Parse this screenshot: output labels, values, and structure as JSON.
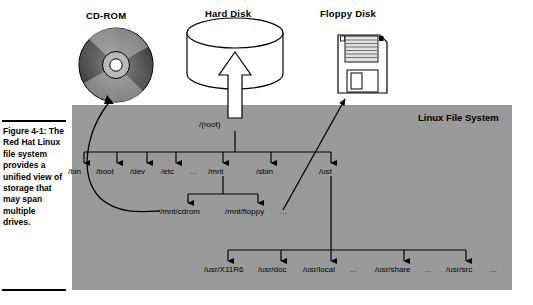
{
  "figure": {
    "caption_title": "Figure 4-1:",
    "caption_body": "The Red Hat Linux file system provides a unified view of storage that may span multiple drives."
  },
  "devices": [
    {
      "name": "cdrom-device",
      "label": "CD-ROM"
    },
    {
      "name": "harddisk-device",
      "label": "Hard Disk"
    },
    {
      "name": "floppy-device",
      "label": "Floppy Disk"
    }
  ],
  "panel": {
    "title": "Linux File System",
    "background_color": "#9a9a9a"
  },
  "tree": {
    "root": "/(root)",
    "level1": [
      {
        "label": "/bin",
        "x": 80
      },
      {
        "label": "/boot",
        "x": 107
      },
      {
        "label": "/dev",
        "x": 139
      },
      {
        "label": "/etc",
        "x": 168
      },
      {
        "label": "...",
        "x": 195,
        "ellipsis": true
      },
      {
        "label": "/mnt",
        "x": 213
      },
      {
        "label": "/sbin",
        "x": 261
      },
      {
        "label": "/ust",
        "x": 324
      }
    ],
    "mnt_children": [
      {
        "label": "/mnt/cdrom",
        "x": 163
      },
      {
        "label": "/mnt/floppy",
        "x": 228
      },
      {
        "label": "...",
        "x": 282,
        "ellipsis": true
      }
    ],
    "usr_children": [
      {
        "label": "/usr/X11R6",
        "x": 207
      },
      {
        "label": "/usr/doc",
        "x": 263
      },
      {
        "label": "/usr/local",
        "x": 306
      },
      {
        "label": "...",
        "x": 353,
        "ellipsis": true
      },
      {
        "label": "/usr/share",
        "x": 381
      },
      {
        "label": "...",
        "x": 430,
        "ellipsis": true
      },
      {
        "label": "/usr/src",
        "x": 451
      },
      {
        "label": "...",
        "x": 495,
        "ellipsis": true
      }
    ]
  },
  "colors": {
    "panel_gray": "#9a9a9a",
    "line_black": "#000000",
    "page_white": "#ffffff"
  }
}
